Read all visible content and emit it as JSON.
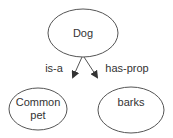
{
  "diagram": {
    "type": "semantic-network",
    "nodes": [
      {
        "id": "dog",
        "label": "Dog"
      },
      {
        "id": "common_pet",
        "label_line1": "Common",
        "label_line2": "pet"
      },
      {
        "id": "barks",
        "label": "barks"
      }
    ],
    "edges": [
      {
        "from": "dog",
        "to": "common_pet",
        "label": "is-a"
      },
      {
        "from": "dog",
        "to": "barks",
        "label": "has-prop"
      }
    ],
    "colors": {
      "stroke": "#555555",
      "text": "#333333",
      "background": "#ffffff"
    }
  }
}
